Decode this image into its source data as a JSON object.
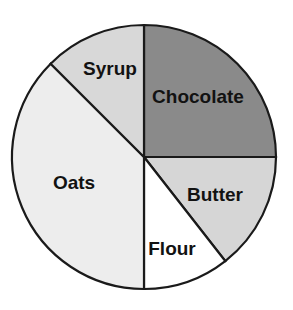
{
  "chart_data": {
    "type": "pie",
    "title": "",
    "subtitle": "",
    "xlabel": "",
    "ylabel": "",
    "legend_position": "none",
    "grid": false,
    "labels_inside_slices": true,
    "start_angle_deg": 0,
    "direction": "clockwise",
    "categories": [
      "Chocolate",
      "Butter",
      "Flour",
      "Oats",
      "Syrup"
    ],
    "values": [
      25,
      14.5,
      10.5,
      37.5,
      12.5
    ],
    "units": "percent",
    "slices": [
      {
        "label": "Chocolate",
        "value": 25,
        "start_angle_deg": 0,
        "end_angle_deg": 90,
        "color": "#8a8a8a",
        "label_x": 198,
        "label_y": 98
      },
      {
        "label": "Butter",
        "value": 14.5,
        "start_angle_deg": 90,
        "end_angle_deg": 142,
        "color": "#d6d6d6",
        "label_x": 215,
        "label_y": 196
      },
      {
        "label": "Flour",
        "value": 10.5,
        "start_angle_deg": 142,
        "end_angle_deg": 180,
        "color": "#ffffff",
        "label_x": 172,
        "label_y": 250
      },
      {
        "label": "Oats",
        "value": 37.5,
        "start_angle_deg": 180,
        "end_angle_deg": 315,
        "color": "#ededed",
        "label_x": 74,
        "label_y": 184
      },
      {
        "label": "Syrup",
        "value": 12.5,
        "start_angle_deg": 315,
        "end_angle_deg": 360,
        "color": "#d8d8d8",
        "label_x": 110,
        "label_y": 70
      }
    ],
    "geometry": {
      "center_x": 144,
      "center_y": 157,
      "radius": 132,
      "outline_color": "#1a1a1a",
      "outline_width": 2.2
    },
    "background_color": "#ffffff",
    "label_text_color": "#121212"
  }
}
